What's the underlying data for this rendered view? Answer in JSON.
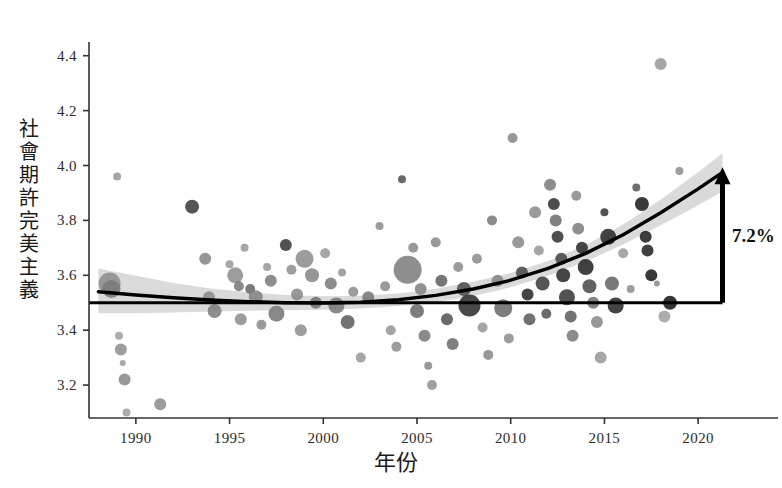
{
  "chart_data": {
    "type": "scatter",
    "title": "",
    "xlabel": "年份",
    "ylabel": "社會期許完美主義",
    "ylabel_chars": [
      "社",
      "會",
      "期",
      "許",
      "完",
      "美",
      "主",
      "義"
    ],
    "xlim": [
      1987.5,
      2022.5
    ],
    "ylim": [
      3.08,
      4.45
    ],
    "xticks": [
      1990,
      1995,
      2000,
      2005,
      2010,
      2015,
      2020
    ],
    "xtick_labels": [
      "1990",
      "1995",
      "2000",
      "2005",
      "2010",
      "2015",
      "2020"
    ],
    "yticks": [
      3.2,
      3.4,
      3.6,
      3.8,
      4.0,
      4.2,
      4.4
    ],
    "ytick_labels": [
      "3.2",
      "3.4",
      "3.6",
      "3.8",
      "4.0",
      "4.2",
      "4.4"
    ],
    "grid": false,
    "legend": null,
    "annotations": [
      {
        "name": "change-arrow-label",
        "text": "7.2%",
        "x": 2021.8,
        "y": 3.72
      }
    ],
    "reference_line": {
      "name": "baseline-1989",
      "y": 3.5,
      "x_start": 1987.5,
      "x_end": 2021.3,
      "style": "solid",
      "color": "#000000"
    },
    "arrow": {
      "name": "growth-arrow",
      "x": 2021.3,
      "y_start": 3.5,
      "y_end": 3.975,
      "head": "up",
      "color": "#000000"
    },
    "trend": {
      "name": "fitted-quadratic-trend",
      "color": "#000000",
      "points": [
        {
          "x": 1988.0,
          "y": 3.54
        },
        {
          "x": 1990.0,
          "y": 3.528
        },
        {
          "x": 1992.0,
          "y": 3.518
        },
        {
          "x": 1994.0,
          "y": 3.51
        },
        {
          "x": 1996.0,
          "y": 3.504
        },
        {
          "x": 1998.0,
          "y": 3.5
        },
        {
          "x": 2000.0,
          "y": 3.499
        },
        {
          "x": 2002.0,
          "y": 3.502
        },
        {
          "x": 2004.0,
          "y": 3.511
        },
        {
          "x": 2006.0,
          "y": 3.527
        },
        {
          "x": 2008.0,
          "y": 3.55
        },
        {
          "x": 2010.0,
          "y": 3.582
        },
        {
          "x": 2012.0,
          "y": 3.625
        },
        {
          "x": 2014.0,
          "y": 3.68
        },
        {
          "x": 2016.0,
          "y": 3.748
        },
        {
          "x": 2018.0,
          "y": 3.828
        },
        {
          "x": 2020.0,
          "y": 3.915
        },
        {
          "x": 2021.3,
          "y": 3.975
        }
      ]
    },
    "confidence_band": {
      "name": "trend-confidence-interval",
      "color": "#d4d4d4",
      "upper": [
        {
          "x": 1988.0,
          "y": 3.625
        },
        {
          "x": 1990.0,
          "y": 3.598
        },
        {
          "x": 1992.0,
          "y": 3.572
        },
        {
          "x": 1994.0,
          "y": 3.552
        },
        {
          "x": 1996.0,
          "y": 3.538
        },
        {
          "x": 1998.0,
          "y": 3.528
        },
        {
          "x": 2000.0,
          "y": 3.524
        },
        {
          "x": 2002.0,
          "y": 3.525
        },
        {
          "x": 2004.0,
          "y": 3.534
        },
        {
          "x": 2006.0,
          "y": 3.551
        },
        {
          "x": 2008.0,
          "y": 3.576
        },
        {
          "x": 2010.0,
          "y": 3.608
        },
        {
          "x": 2012.0,
          "y": 3.652
        },
        {
          "x": 2014.0,
          "y": 3.71
        },
        {
          "x": 2016.0,
          "y": 3.785
        },
        {
          "x": 2018.0,
          "y": 3.875
        },
        {
          "x": 2020.0,
          "y": 3.975
        },
        {
          "x": 2021.3,
          "y": 4.045
        }
      ],
      "lower": [
        {
          "x": 1988.0,
          "y": 3.462
        },
        {
          "x": 1990.0,
          "y": 3.462
        },
        {
          "x": 1992.0,
          "y": 3.464
        },
        {
          "x": 1994.0,
          "y": 3.468
        },
        {
          "x": 1996.0,
          "y": 3.471
        },
        {
          "x": 1998.0,
          "y": 3.473
        },
        {
          "x": 2000.0,
          "y": 3.474
        },
        {
          "x": 2002.0,
          "y": 3.479
        },
        {
          "x": 2004.0,
          "y": 3.488
        },
        {
          "x": 2006.0,
          "y": 3.503
        },
        {
          "x": 2008.0,
          "y": 3.524
        },
        {
          "x": 2010.0,
          "y": 3.556
        },
        {
          "x": 2012.0,
          "y": 3.598
        },
        {
          "x": 2014.0,
          "y": 3.65
        },
        {
          "x": 2016.0,
          "y": 3.712
        },
        {
          "x": 2018.0,
          "y": 3.782
        },
        {
          "x": 2020.0,
          "y": 3.855
        },
        {
          "x": 2021.3,
          "y": 3.905
        }
      ]
    },
    "points": [
      {
        "x": 1988.6,
        "y": 3.57,
        "r": 11,
        "c": "#8c8c8c"
      },
      {
        "x": 1988.7,
        "y": 3.55,
        "r": 9,
        "c": "#7a7a7a"
      },
      {
        "x": 1989.0,
        "y": 3.96,
        "r": 4,
        "c": "#9a9a9a"
      },
      {
        "x": 1989.1,
        "y": 3.38,
        "r": 4,
        "c": "#a2a2a2"
      },
      {
        "x": 1989.2,
        "y": 3.33,
        "r": 6,
        "c": "#8f8f8f"
      },
      {
        "x": 1989.3,
        "y": 3.28,
        "r": 3,
        "c": "#9c9c9c"
      },
      {
        "x": 1989.4,
        "y": 3.22,
        "r": 6,
        "c": "#8a8a8a"
      },
      {
        "x": 1989.5,
        "y": 3.1,
        "r": 4,
        "c": "#9e9e9e"
      },
      {
        "x": 1991.3,
        "y": 3.13,
        "r": 6,
        "c": "#8d8d8d"
      },
      {
        "x": 1993.0,
        "y": 3.85,
        "r": 7,
        "c": "#3d3d3d"
      },
      {
        "x": 1993.7,
        "y": 3.66,
        "r": 6,
        "c": "#888888"
      },
      {
        "x": 1993.9,
        "y": 3.52,
        "r": 6,
        "c": "#8b8b8b"
      },
      {
        "x": 1994.2,
        "y": 3.47,
        "r": 7,
        "c": "#7f7f7f"
      },
      {
        "x": 1995.0,
        "y": 3.64,
        "r": 4,
        "c": "#9b9b9b"
      },
      {
        "x": 1995.3,
        "y": 3.6,
        "r": 8,
        "c": "#8f8f8f"
      },
      {
        "x": 1995.5,
        "y": 3.56,
        "r": 5,
        "c": "#7b7b7b"
      },
      {
        "x": 1995.6,
        "y": 3.44,
        "r": 6,
        "c": "#909090"
      },
      {
        "x": 1995.8,
        "y": 3.7,
        "r": 4,
        "c": "#9a9a9a"
      },
      {
        "x": 1996.1,
        "y": 3.55,
        "r": 5,
        "c": "#6a6a6a"
      },
      {
        "x": 1996.4,
        "y": 3.52,
        "r": 7,
        "c": "#838383"
      },
      {
        "x": 1996.7,
        "y": 3.42,
        "r": 5,
        "c": "#8c8c8c"
      },
      {
        "x": 1997.0,
        "y": 3.63,
        "r": 4,
        "c": "#9a9a9a"
      },
      {
        "x": 1997.2,
        "y": 3.58,
        "r": 6,
        "c": "#7d7d7d"
      },
      {
        "x": 1997.5,
        "y": 3.46,
        "r": 8,
        "c": "#777777"
      },
      {
        "x": 1998.0,
        "y": 3.71,
        "r": 6,
        "c": "#3a3a3a"
      },
      {
        "x": 1998.3,
        "y": 3.62,
        "r": 5,
        "c": "#919191"
      },
      {
        "x": 1998.6,
        "y": 3.53,
        "r": 6,
        "c": "#8a8a8a"
      },
      {
        "x": 1998.8,
        "y": 3.4,
        "r": 6,
        "c": "#8f8f8f"
      },
      {
        "x": 1999.0,
        "y": 3.66,
        "r": 9,
        "c": "#8e8e8e"
      },
      {
        "x": 1999.4,
        "y": 3.6,
        "r": 7,
        "c": "#888888"
      },
      {
        "x": 1999.6,
        "y": 3.5,
        "r": 6,
        "c": "#6f6f6f"
      },
      {
        "x": 2000.1,
        "y": 3.68,
        "r": 5,
        "c": "#9a9a9a"
      },
      {
        "x": 2000.4,
        "y": 3.57,
        "r": 6,
        "c": "#7c7c7c"
      },
      {
        "x": 2000.7,
        "y": 3.49,
        "r": 8,
        "c": "#7a7a7a"
      },
      {
        "x": 2001.0,
        "y": 3.61,
        "r": 4,
        "c": "#969696"
      },
      {
        "x": 2001.3,
        "y": 3.43,
        "r": 7,
        "c": "#606060"
      },
      {
        "x": 2001.6,
        "y": 3.54,
        "r": 5,
        "c": "#8d8d8d"
      },
      {
        "x": 2002.0,
        "y": 3.3,
        "r": 5,
        "c": "#9b9b9b"
      },
      {
        "x": 2002.4,
        "y": 3.52,
        "r": 6,
        "c": "#787878"
      },
      {
        "x": 2003.0,
        "y": 3.78,
        "r": 4,
        "c": "#909090"
      },
      {
        "x": 2003.3,
        "y": 3.56,
        "r": 5,
        "c": "#8b8b8b"
      },
      {
        "x": 2003.6,
        "y": 3.4,
        "r": 5,
        "c": "#999999"
      },
      {
        "x": 2003.9,
        "y": 3.34,
        "r": 5,
        "c": "#8e8e8e"
      },
      {
        "x": 2004.2,
        "y": 3.95,
        "r": 4,
        "c": "#555555"
      },
      {
        "x": 2004.5,
        "y": 3.62,
        "r": 14,
        "c": "#7e7e7e"
      },
      {
        "x": 2004.8,
        "y": 3.7,
        "r": 5,
        "c": "#8c8c8c"
      },
      {
        "x": 2005.0,
        "y": 3.47,
        "r": 7,
        "c": "#6b6b6b"
      },
      {
        "x": 2005.2,
        "y": 3.55,
        "r": 6,
        "c": "#838383"
      },
      {
        "x": 2005.4,
        "y": 3.38,
        "r": 6,
        "c": "#7a7a7a"
      },
      {
        "x": 2005.6,
        "y": 3.27,
        "r": 4,
        "c": "#8d8d8d"
      },
      {
        "x": 2005.8,
        "y": 3.2,
        "r": 5,
        "c": "#929292"
      },
      {
        "x": 2006.0,
        "y": 3.72,
        "r": 5,
        "c": "#8b8b8b"
      },
      {
        "x": 2006.3,
        "y": 3.58,
        "r": 6,
        "c": "#636363"
      },
      {
        "x": 2006.6,
        "y": 3.44,
        "r": 6,
        "c": "#565656"
      },
      {
        "x": 2006.9,
        "y": 3.35,
        "r": 6,
        "c": "#6d6d6d"
      },
      {
        "x": 2007.2,
        "y": 3.63,
        "r": 5,
        "c": "#8d8d8d"
      },
      {
        "x": 2007.5,
        "y": 3.55,
        "r": 7,
        "c": "#4e4e4e"
      },
      {
        "x": 2007.8,
        "y": 3.49,
        "r": 11,
        "c": "#2f2f2f"
      },
      {
        "x": 2008.2,
        "y": 3.66,
        "r": 5,
        "c": "#8e8e8e"
      },
      {
        "x": 2008.5,
        "y": 3.41,
        "r": 5,
        "c": "#999999"
      },
      {
        "x": 2008.8,
        "y": 3.31,
        "r": 5,
        "c": "#8a8a8a"
      },
      {
        "x": 2009.0,
        "y": 3.8,
        "r": 5,
        "c": "#7b7b7b"
      },
      {
        "x": 2009.3,
        "y": 3.58,
        "r": 6,
        "c": "#858585"
      },
      {
        "x": 2009.6,
        "y": 3.48,
        "r": 9,
        "c": "#6b6b6b"
      },
      {
        "x": 2009.9,
        "y": 3.37,
        "r": 5,
        "c": "#8f8f8f"
      },
      {
        "x": 2010.1,
        "y": 4.1,
        "r": 5,
        "c": "#8a8a8a"
      },
      {
        "x": 2010.4,
        "y": 3.72,
        "r": 6,
        "c": "#8c8c8c"
      },
      {
        "x": 2010.6,
        "y": 3.61,
        "r": 6,
        "c": "#4a4a4a"
      },
      {
        "x": 2010.9,
        "y": 3.53,
        "r": 6,
        "c": "#2b2b2b"
      },
      {
        "x": 2011.0,
        "y": 3.44,
        "r": 6,
        "c": "#5f5f5f"
      },
      {
        "x": 2011.3,
        "y": 3.83,
        "r": 6,
        "c": "#8d8d8d"
      },
      {
        "x": 2011.5,
        "y": 3.69,
        "r": 5,
        "c": "#9a9a9a"
      },
      {
        "x": 2011.7,
        "y": 3.57,
        "r": 7,
        "c": "#3f3f3f"
      },
      {
        "x": 2011.9,
        "y": 3.46,
        "r": 5,
        "c": "#565656"
      },
      {
        "x": 2012.1,
        "y": 3.93,
        "r": 6,
        "c": "#7d7d7d"
      },
      {
        "x": 2012.3,
        "y": 3.86,
        "r": 6,
        "c": "#343434"
      },
      {
        "x": 2012.4,
        "y": 3.8,
        "r": 6,
        "c": "#6e6e6e"
      },
      {
        "x": 2012.5,
        "y": 3.74,
        "r": 6,
        "c": "#383838"
      },
      {
        "x": 2012.7,
        "y": 3.66,
        "r": 6,
        "c": "#454545"
      },
      {
        "x": 2012.8,
        "y": 3.6,
        "r": 7,
        "c": "#2e2e2e"
      },
      {
        "x": 2013.0,
        "y": 3.52,
        "r": 8,
        "c": "#3a3a3a"
      },
      {
        "x": 2013.2,
        "y": 3.45,
        "r": 6,
        "c": "#616161"
      },
      {
        "x": 2013.3,
        "y": 3.38,
        "r": 6,
        "c": "#7b7b7b"
      },
      {
        "x": 2013.5,
        "y": 3.89,
        "r": 5,
        "c": "#8b8b8b"
      },
      {
        "x": 2013.6,
        "y": 3.77,
        "r": 6,
        "c": "#7f7f7f"
      },
      {
        "x": 2013.8,
        "y": 3.7,
        "r": 6,
        "c": "#2f2f2f"
      },
      {
        "x": 2014.0,
        "y": 3.63,
        "r": 8,
        "c": "#262626"
      },
      {
        "x": 2014.2,
        "y": 3.56,
        "r": 7,
        "c": "#4c4c4c"
      },
      {
        "x": 2014.4,
        "y": 3.5,
        "r": 6,
        "c": "#737373"
      },
      {
        "x": 2014.6,
        "y": 3.43,
        "r": 6,
        "c": "#8a8a8a"
      },
      {
        "x": 2014.8,
        "y": 3.3,
        "r": 6,
        "c": "#9a9a9a"
      },
      {
        "x": 2015.0,
        "y": 3.83,
        "r": 4,
        "c": "#3b3b3b"
      },
      {
        "x": 2015.2,
        "y": 3.74,
        "r": 8,
        "c": "#2a2a2a"
      },
      {
        "x": 2015.4,
        "y": 3.57,
        "r": 7,
        "c": "#666666"
      },
      {
        "x": 2015.6,
        "y": 3.49,
        "r": 8,
        "c": "#2b2b2b"
      },
      {
        "x": 2016.0,
        "y": 3.68,
        "r": 5,
        "c": "#9d9d9d"
      },
      {
        "x": 2016.4,
        "y": 3.55,
        "r": 4,
        "c": "#8f8f8f"
      },
      {
        "x": 2016.7,
        "y": 3.92,
        "r": 4,
        "c": "#5a5a5a"
      },
      {
        "x": 2017.0,
        "y": 3.86,
        "r": 7,
        "c": "#1f1f1f"
      },
      {
        "x": 2017.2,
        "y": 3.74,
        "r": 6,
        "c": "#222222"
      },
      {
        "x": 2017.3,
        "y": 3.69,
        "r": 6,
        "c": "#252525"
      },
      {
        "x": 2017.5,
        "y": 3.6,
        "r": 6,
        "c": "#1e1e1e"
      },
      {
        "x": 2017.8,
        "y": 3.57,
        "r": 3,
        "c": "#8d8d8d"
      },
      {
        "x": 2018.0,
        "y": 4.37,
        "r": 6,
        "c": "#9a9a9a"
      },
      {
        "x": 2018.2,
        "y": 3.45,
        "r": 6,
        "c": "#a3a3a3"
      },
      {
        "x": 2018.5,
        "y": 3.5,
        "r": 7,
        "c": "#1a1a1a"
      },
      {
        "x": 2019.0,
        "y": 3.98,
        "r": 4,
        "c": "#8f8f8f"
      }
    ]
  },
  "axis_style": {
    "line_color": "#333333",
    "tick_color": "#333333",
    "background": "#ffffff"
  }
}
